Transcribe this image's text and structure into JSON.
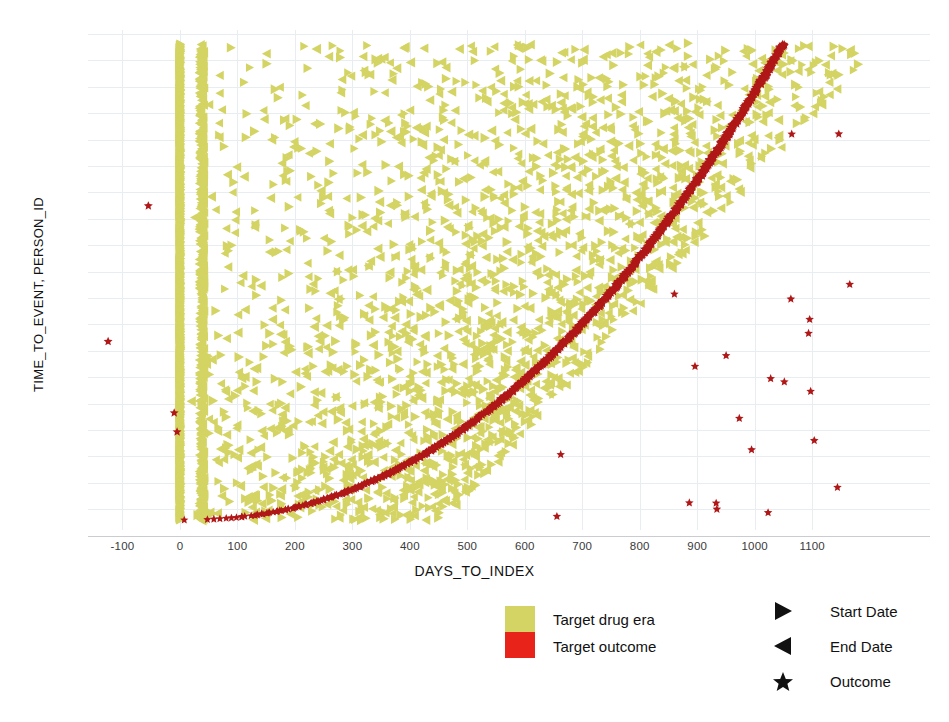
{
  "chart_data": {
    "type": "scatter",
    "title": "",
    "xlabel": "DAYS_TO_INDEX",
    "ylabel": "TIME_TO_EVENT, PERSON_ID",
    "xlim": [
      -160,
      1305
    ],
    "ylim": [
      0,
      1
    ],
    "grid": true,
    "xticks": [
      -100,
      0,
      100,
      200,
      300,
      400,
      500,
      600,
      700,
      800,
      900,
      1000,
      1100
    ],
    "xtick_labels": [
      "-100",
      "0",
      "100",
      "200",
      "300",
      "400",
      "500",
      "600",
      "700",
      "800",
      "900",
      "1000",
      "1100"
    ],
    "yticks": [],
    "ytick_labels": [],
    "series": [
      {
        "name": "Start Date",
        "marker": "right-triangle",
        "color": "#d4d464",
        "description": "Target drug era start dates, one per person, dense vertical band at day 0 plus scattered points across the plot"
      },
      {
        "name": "End Date",
        "marker": "left-triangle",
        "color": "#d4d464",
        "description": "Target drug era end dates, scattered across 0 to 1200 days, secondary vertical band near day 40"
      },
      {
        "name": "Outcome",
        "marker": "star",
        "color": "#b01818",
        "description": "Outcome events; dense monotonically rising band of sorted outcome times from day 0 up to about day 1050, plus sparse isolated outcomes"
      }
    ],
    "annotations": [
      "Dense vertical marker column at DAYS_TO_INDEX = 0 spanning the full person axis",
      "Second vertical marker column near DAYS_TO_INDEX = 40",
      "Sorted red outcome curve rises steeply from day 0 then flattens after about day 700",
      "Isolated red outcome markers appear at negative DAYS_TO_INDEX values near -125 and -55"
    ]
  },
  "axes": {
    "x_title": "DAYS_TO_INDEX",
    "y_title": "TIME_TO_EVENT, PERSON_ID"
  },
  "color_legend": {
    "swatches": [
      {
        "label": "Target drug era",
        "color": "#d4d464"
      },
      {
        "label": "Target outcome",
        "color": "#e8241a"
      }
    ]
  },
  "shape_legend": {
    "items": [
      {
        "label": "Start Date",
        "icon": "right-triangle-icon"
      },
      {
        "label": "End Date",
        "icon": "left-triangle-icon"
      },
      {
        "label": "Outcome",
        "icon": "star-icon"
      }
    ]
  },
  "style": {
    "marker_yellow": "#d4d464",
    "marker_red": "#b01818",
    "legend_red": "#e8241a",
    "grid_color": "#e8edf2",
    "axis_color": "#c9cdd2",
    "background": "#ffffff"
  }
}
